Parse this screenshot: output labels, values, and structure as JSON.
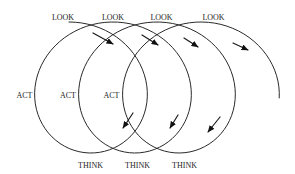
{
  "diagram": {
    "labels": {
      "look": [
        "LOOK",
        "LOOK",
        "LOOK",
        "LOOK"
      ],
      "act": [
        "ACT",
        "ACT",
        "ACT"
      ],
      "think": [
        "THINK",
        "THINK",
        "THINK"
      ]
    },
    "spiral": {
      "x0": 69,
      "drift": 7,
      "rx": 67,
      "cy": 87.5,
      "ry": 65.5,
      "t0": 0,
      "t1": 20.58,
      "steps": 240
    },
    "arrows": [
      {
        "from": [
          93,
          33
        ],
        "to": [
          113,
          44
        ]
      },
      {
        "from": [
          142,
          35
        ],
        "to": [
          158,
          45
        ]
      },
      {
        "from": [
          184,
          38
        ],
        "to": [
          198,
          47
        ]
      },
      {
        "from": [
          233,
          43
        ],
        "to": [
          248,
          50
        ]
      },
      {
        "from": [
          133,
          113
        ],
        "to": [
          123,
          128
        ]
      },
      {
        "from": [
          178,
          115
        ],
        "to": [
          170,
          128
        ]
      },
      {
        "from": [
          220,
          117
        ],
        "to": [
          208,
          132
        ]
      }
    ],
    "colors": {
      "line": "#2a2a2a",
      "text": "#1e1e1e",
      "background": "#ffffff"
    }
  }
}
